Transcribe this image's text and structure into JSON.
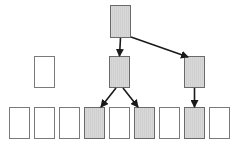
{
  "diagram": {
    "colors": {
      "shaded_fill": "#d0d0d0",
      "empty_fill": "#ffffff",
      "border": "#7a7a7a",
      "arrow": "#1a1a1a"
    },
    "nodes": [
      {
        "id": "root",
        "x": 110,
        "y": 5,
        "w": 21,
        "h": 33,
        "shaded": true
      },
      {
        "id": "mid-left",
        "x": 34,
        "y": 56,
        "w": 21,
        "h": 32,
        "shaded": false
      },
      {
        "id": "mid-center",
        "x": 109,
        "y": 56,
        "w": 21,
        "h": 32,
        "shaded": true
      },
      {
        "id": "mid-right",
        "x": 184,
        "y": 56,
        "w": 21,
        "h": 32,
        "shaded": true
      },
      {
        "id": "leaf-0",
        "x": 9,
        "y": 107,
        "w": 21,
        "h": 32,
        "shaded": false
      },
      {
        "id": "leaf-1",
        "x": 34,
        "y": 107,
        "w": 21,
        "h": 32,
        "shaded": false
      },
      {
        "id": "leaf-2",
        "x": 59,
        "y": 107,
        "w": 21,
        "h": 32,
        "shaded": false
      },
      {
        "id": "leaf-3",
        "x": 84,
        "y": 107,
        "w": 21,
        "h": 32,
        "shaded": true
      },
      {
        "id": "leaf-4",
        "x": 109,
        "y": 107,
        "w": 21,
        "h": 32,
        "shaded": false
      },
      {
        "id": "leaf-5",
        "x": 134,
        "y": 107,
        "w": 21,
        "h": 32,
        "shaded": true
      },
      {
        "id": "leaf-6",
        "x": 159,
        "y": 107,
        "w": 21,
        "h": 32,
        "shaded": false
      },
      {
        "id": "leaf-7",
        "x": 184,
        "y": 107,
        "w": 21,
        "h": 32,
        "shaded": true
      },
      {
        "id": "leaf-8",
        "x": 209,
        "y": 107,
        "w": 21,
        "h": 32,
        "shaded": false
      }
    ],
    "edges": [
      {
        "from": "root",
        "to": "mid-center"
      },
      {
        "from": "root",
        "to": "mid-right"
      },
      {
        "from": "mid-center",
        "to": "leaf-3"
      },
      {
        "from": "mid-center",
        "to": "leaf-5"
      },
      {
        "from": "mid-right",
        "to": "leaf-7"
      }
    ]
  }
}
